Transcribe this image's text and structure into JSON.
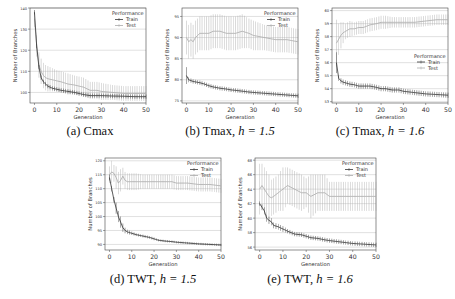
{
  "figure": {
    "colors": {
      "train": "#333333",
      "test": "#aaaaaa",
      "grid": "#cccccc",
      "axis": "#444444",
      "text": "#333333"
    },
    "legend_title": "Performance",
    "legend_train": "Train",
    "legend_test": "Test",
    "xlabel": "Generation",
    "ylabel": "Number of Branches"
  },
  "chart_data": [
    {
      "id": "a",
      "type": "line",
      "title": "(a) Cmax",
      "caption_prefix": "(a) Cmax",
      "caption_h": "",
      "xlabel": "Generation",
      "ylabel": "Number of Branches",
      "xlim": [
        -2,
        50
      ],
      "ylim": [
        95,
        140
      ],
      "xticks": [
        0,
        10,
        20,
        30,
        40,
        50
      ],
      "yticks": [
        100,
        110,
        120,
        130,
        140
      ],
      "legend_position": "upper right",
      "grid": true,
      "series": [
        {
          "name": "Train",
          "x": [
            0,
            1,
            2,
            3,
            4,
            5,
            6,
            8,
            10,
            12,
            15,
            18,
            20,
            22,
            25,
            28,
            30,
            35,
            40,
            45,
            50
          ],
          "values": [
            138,
            122,
            112,
            107,
            105,
            104,
            103,
            102,
            101.5,
            101,
            100.5,
            100,
            99.5,
            99,
            98.5,
            98.5,
            98.5,
            98.3,
            98.2,
            98,
            98
          ],
          "err": [
            1,
            1,
            1,
            1,
            1,
            1,
            1,
            1,
            1,
            1,
            1,
            1,
            1,
            1,
            1,
            1,
            1,
            1,
            1,
            1,
            1
          ]
        },
        {
          "name": "Test",
          "x": [
            0,
            1,
            2,
            3,
            4,
            5,
            6,
            8,
            10,
            12,
            15,
            18,
            20,
            22,
            25,
            28,
            30,
            35,
            40,
            45,
            50
          ],
          "values": [
            135,
            122,
            113,
            110,
            108,
            107,
            106.5,
            106,
            105.5,
            105,
            104,
            103.5,
            103,
            102.5,
            101,
            101,
            100.5,
            100,
            99.5,
            99.5,
            99.5
          ],
          "err": [
            4,
            5,
            6,
            6,
            6,
            6,
            6,
            5.5,
            5,
            5,
            5,
            4.5,
            4.5,
            4.5,
            4,
            4,
            4,
            3.5,
            3.5,
            3.5,
            3.5
          ]
        }
      ]
    },
    {
      "id": "b",
      "type": "line",
      "title": "(b) Tmax, h = 1.5",
      "caption_prefix": "(b) Tmax, ",
      "caption_h": "h = 1.5",
      "xlabel": "Generation",
      "ylabel": "Number of Branches",
      "xlim": [
        -2,
        50
      ],
      "ylim": [
        74.5,
        97
      ],
      "xticks": [
        0,
        10,
        20,
        30,
        40,
        50
      ],
      "yticks": [
        75,
        80,
        85,
        90,
        95
      ],
      "legend_position": "upper right",
      "grid": true,
      "series": [
        {
          "name": "Train",
          "x": [
            0,
            1,
            2,
            3,
            4,
            5,
            6,
            8,
            10,
            12,
            15,
            18,
            20,
            22,
            25,
            28,
            30,
            35,
            40,
            45,
            50
          ],
          "values": [
            81,
            80,
            79.8,
            79.6,
            79.5,
            79.4,
            79.3,
            79.0,
            78.6,
            78.3,
            78.0,
            77.8,
            77.6,
            77.5,
            77.3,
            77.1,
            77.0,
            76.8,
            76.6,
            76.4,
            76.2
          ],
          "err": [
            2,
            0.6,
            0.5,
            0.5,
            0.5,
            0.5,
            0.5,
            0.5,
            0.5,
            0.5,
            0.5,
            0.5,
            0.5,
            0.5,
            0.5,
            0.5,
            0.5,
            0.5,
            0.5,
            0.5,
            0.5
          ]
        },
        {
          "name": "Test",
          "x": [
            0,
            1,
            2,
            3,
            4,
            5,
            6,
            8,
            10,
            12,
            15,
            18,
            20,
            22,
            25,
            28,
            30,
            35,
            40,
            45,
            50
          ],
          "values": [
            90,
            89,
            89.5,
            89,
            90,
            90.5,
            91,
            91,
            91,
            91.5,
            91.5,
            91,
            91,
            91,
            91.5,
            91,
            90.5,
            90,
            89.5,
            89.5,
            89
          ],
          "err": [
            4,
            4,
            4,
            4,
            4,
            4,
            4,
            4,
            4,
            4,
            4,
            4,
            4,
            4,
            4,
            3.5,
            3.5,
            3,
            3,
            3,
            3
          ]
        }
      ]
    },
    {
      "id": "c",
      "type": "line",
      "title": "(c) Tmax, h = 1.6",
      "caption_prefix": "(c) Tmax, ",
      "caption_h": "h = 1.6",
      "xlabel": "Generation",
      "ylabel": "Number of Branches",
      "xlim": [
        -2,
        50
      ],
      "ylim": [
        52.9,
        60.2
      ],
      "xticks": [
        0,
        10,
        20,
        30,
        40,
        50
      ],
      "yticks": [
        53,
        54,
        55,
        56,
        57,
        58,
        59,
        60
      ],
      "legend_position": "center right",
      "grid": true,
      "series": [
        {
          "name": "Train",
          "x": [
            0,
            1,
            2,
            3,
            4,
            5,
            6,
            8,
            10,
            12,
            15,
            18,
            20,
            22,
            25,
            28,
            30,
            35,
            40,
            45,
            50
          ],
          "values": [
            56,
            54.8,
            54.6,
            54.5,
            54.45,
            54.4,
            54.35,
            54.3,
            54.2,
            54.2,
            54.2,
            54.1,
            54.0,
            54.0,
            53.9,
            53.9,
            53.8,
            53.7,
            53.6,
            53.55,
            53.5
          ],
          "err": [
            0.8,
            0.2,
            0.2,
            0.2,
            0.2,
            0.2,
            0.2,
            0.2,
            0.2,
            0.2,
            0.2,
            0.2,
            0.2,
            0.2,
            0.2,
            0.2,
            0.2,
            0.2,
            0.2,
            0.2,
            0.2
          ]
        },
        {
          "name": "Test",
          "x": [
            0,
            1,
            2,
            3,
            4,
            5,
            6,
            8,
            10,
            12,
            15,
            18,
            20,
            22,
            25,
            28,
            30,
            35,
            40,
            45,
            50
          ],
          "values": [
            57.5,
            57.8,
            58.1,
            58.3,
            58.4,
            58.5,
            58.6,
            58.6,
            58.7,
            58.7,
            58.9,
            59.0,
            59.1,
            59.1,
            59.1,
            59.1,
            59.1,
            59.1,
            59.2,
            59.3,
            59.3
          ],
          "err": [
            1.8,
            1.2,
            1,
            0.8,
            0.6,
            0.6,
            0.6,
            0.5,
            0.5,
            0.5,
            0.5,
            0.5,
            0.5,
            0.5,
            0.4,
            0.4,
            0.4,
            0.4,
            0.4,
            0.4,
            0.4
          ]
        }
      ]
    },
    {
      "id": "d",
      "type": "line",
      "title": "(d) TWT, h = 1.5",
      "caption_prefix": "(d) TWT, ",
      "caption_h": "h = 1.5",
      "xlabel": "Generation",
      "ylabel": "Number of Branches",
      "xlim": [
        -2,
        50
      ],
      "ylim": [
        88,
        121
      ],
      "xticks": [
        0,
        10,
        20,
        30,
        40,
        50
      ],
      "yticks": [
        90,
        95,
        100,
        105,
        110,
        115,
        120
      ],
      "legend_position": "upper right",
      "grid": true,
      "series": [
        {
          "name": "Train",
          "x": [
            0,
            1,
            2,
            3,
            4,
            5,
            6,
            7,
            8,
            10,
            12,
            15,
            18,
            20,
            22,
            25,
            28,
            30,
            35,
            40,
            45,
            50
          ],
          "values": [
            114,
            110,
            106,
            103,
            100,
            98,
            96,
            95,
            94.5,
            94,
            93.5,
            93,
            92.5,
            92,
            91.5,
            91.2,
            91,
            90.8,
            90.5,
            90.2,
            90,
            89.8
          ],
          "err": [
            1,
            1,
            1,
            2,
            2,
            2,
            1.5,
            1,
            0.8,
            0.6,
            0.5,
            0.5,
            0.5,
            0.5,
            0.4,
            0.4,
            0.4,
            0.4,
            0.4,
            0.4,
            0.4,
            0.4
          ]
        },
        {
          "name": "Test",
          "x": [
            0,
            1,
            2,
            3,
            4,
            5,
            6,
            7,
            8,
            10,
            12,
            15,
            18,
            20,
            22,
            25,
            28,
            30,
            35,
            40,
            45,
            50
          ],
          "values": [
            115,
            116,
            115.5,
            114,
            112,
            113,
            114.5,
            113,
            112.5,
            112.5,
            112.5,
            112.5,
            112.5,
            112.5,
            112.5,
            112.5,
            112.5,
            112,
            112,
            111.5,
            111.5,
            111
          ],
          "err": [
            3,
            4,
            3,
            4,
            4,
            4,
            3,
            3,
            3,
            3,
            3,
            2.5,
            2.5,
            2.5,
            2.5,
            2.5,
            2.5,
            2.5,
            2.5,
            2.5,
            2.5,
            2.5
          ]
        }
      ]
    },
    {
      "id": "e",
      "type": "line",
      "title": "(e) TWT, h = 1.6",
      "caption_prefix": "(e) TWT, ",
      "caption_h": "h = 1.6",
      "xlabel": "Generation",
      "ylabel": "Number of Branches",
      "xlim": [
        -2,
        50
      ],
      "ylim": [
        55.6,
        68.3
      ],
      "xticks": [
        0,
        10,
        20,
        30,
        40,
        50
      ],
      "yticks": [
        56,
        58,
        60,
        62,
        64,
        66,
        68
      ],
      "legend_position": "upper right",
      "grid": true,
      "series": [
        {
          "name": "Train",
          "x": [
            0,
            1,
            2,
            3,
            4,
            5,
            6,
            8,
            10,
            12,
            15,
            18,
            20,
            22,
            25,
            28,
            30,
            35,
            40,
            45,
            50
          ],
          "values": [
            62,
            61.5,
            61,
            60,
            59.7,
            59.5,
            59,
            58.8,
            58.5,
            58.2,
            57.8,
            57.7,
            57.5,
            57.3,
            57.2,
            57.0,
            56.9,
            56.7,
            56.5,
            56.4,
            56.3
          ],
          "err": [
            0.3,
            0.4,
            0.5,
            0.5,
            0.5,
            0.5,
            0.4,
            0.4,
            0.4,
            0.3,
            0.3,
            0.3,
            0.3,
            0.3,
            0.3,
            0.3,
            0.3,
            0.3,
            0.3,
            0.3,
            0.3
          ]
        },
        {
          "name": "Test",
          "x": [
            0,
            1,
            2,
            3,
            4,
            5,
            6,
            8,
            10,
            12,
            15,
            18,
            20,
            22,
            25,
            28,
            30,
            35,
            40,
            45,
            50
          ],
          "values": [
            64,
            64.5,
            64,
            63.5,
            63,
            62.8,
            63,
            63.5,
            64,
            64.5,
            64,
            63.5,
            63.5,
            63,
            63.5,
            63.5,
            63,
            63,
            63,
            63,
            63
          ],
          "err": [
            3.5,
            3,
            3,
            3,
            3,
            2.5,
            2.5,
            2.5,
            3,
            2.5,
            2.5,
            2.5,
            2,
            3,
            2.5,
            2.5,
            2,
            2,
            2,
            2,
            2
          ]
        }
      ]
    }
  ]
}
